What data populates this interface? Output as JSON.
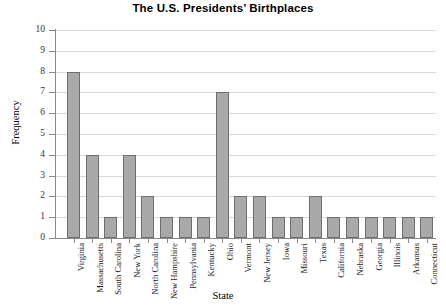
{
  "chart_data": {
    "type": "bar",
    "title": "The U.S. Presidents’ Birthplaces",
    "xlabel": "State",
    "ylabel": "Frequency",
    "ylim": [
      0,
      10
    ],
    "ytick_labels": [
      "0",
      "1",
      "2",
      "3",
      "4",
      "5",
      "6",
      "7",
      "8",
      "9",
      "10"
    ],
    "grid": "horizontal",
    "legend": "none",
    "bar_color": "#a9a9a9",
    "bar_edge_color": "#6e6e6e",
    "gridline_color": "#d9d9d9",
    "axis_color": "#8a8a8a",
    "categories": [
      "Virginia",
      "Massachusetts",
      "South Carolina",
      "New York",
      "North Carolina",
      "New Hampshire",
      "Pennsylvania",
      "Kentucky",
      "Ohio",
      "Vermont",
      "New Jersey",
      "Iowa",
      "Missouri",
      "Texas",
      "California",
      "Nebraska",
      "Georgia",
      "Illinois",
      "Arkansas",
      "Connecticut"
    ],
    "values": [
      8,
      4,
      1,
      4,
      2,
      1,
      1,
      1,
      7,
      2,
      2,
      1,
      1,
      2,
      1,
      1,
      1,
      1,
      1,
      1
    ]
  }
}
